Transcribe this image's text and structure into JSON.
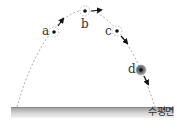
{
  "diagram": {
    "ground": {
      "label": "수평면",
      "color_top": "#9a9a9a",
      "color_bottom": "#f2f2f2"
    },
    "trajectory": {
      "style": "dashed",
      "color": "#888888",
      "start": [
        17,
        107
      ],
      "apex": [
        85,
        10
      ],
      "end": [
        155,
        107
      ]
    },
    "points": [
      {
        "id": "a",
        "label": "a",
        "x": 54,
        "y": 32,
        "arrow": "up-right",
        "highlighted": false
      },
      {
        "id": "b",
        "label": "b",
        "x": 85,
        "y": 11,
        "arrow": "right",
        "highlighted": false
      },
      {
        "id": "c",
        "label": "c",
        "x": 117,
        "y": 31,
        "arrow": "down-right",
        "highlighted": false
      },
      {
        "id": "d",
        "label": "d",
        "x": 141,
        "y": 70,
        "arrow": "down-right",
        "highlighted": true
      }
    ]
  }
}
